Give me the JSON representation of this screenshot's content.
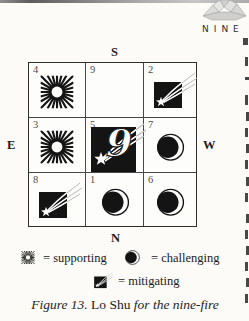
{
  "page": {
    "chapter_header": "NINE",
    "figure_caption": {
      "figure_label": "Figure 13.",
      "title": " Lo Shu ",
      "subtitle": "for the nine-fire"
    }
  },
  "compass": {
    "south": "S",
    "east": "E",
    "west": "W",
    "north": "N"
  },
  "grid": {
    "center_numeral": "9",
    "cells": [
      {
        "number": "4",
        "symbol": "supporting-starburst"
      },
      {
        "number": "9",
        "symbol": "empty"
      },
      {
        "number": "2",
        "symbol": "mitigating-shooting-star"
      },
      {
        "number": "3",
        "symbol": "supporting-starburst"
      },
      {
        "number": "5",
        "symbol": "nine-fire-shooting-star"
      },
      {
        "number": "7",
        "symbol": "challenging-moon"
      },
      {
        "number": "8",
        "symbol": "mitigating-shooting-star"
      },
      {
        "number": "1",
        "symbol": "challenging-moon"
      },
      {
        "number": "6",
        "symbol": "challenging-moon"
      }
    ]
  },
  "legend": {
    "items": [
      {
        "symbol": "starburst-icon",
        "label": "= supporting"
      },
      {
        "symbol": "moon-icon",
        "label": "= challenging"
      },
      {
        "symbol": "shooting-star-icon",
        "label": "= mitigating"
      }
    ]
  },
  "colors": {
    "ink": "#141414",
    "paper": "#fcfbf8",
    "gem_fill": "#d9d9d6"
  }
}
